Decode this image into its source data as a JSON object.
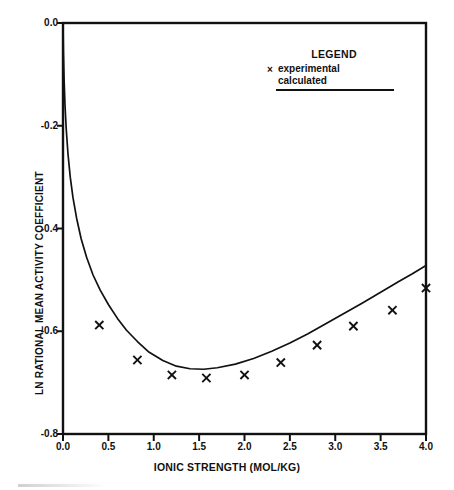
{
  "chart_data": {
    "type": "line",
    "title": "",
    "xlabel": "IONIC STRENGTH (MOL/KG)",
    "ylabel": "LN RATIONAL MEAN ACTIVITY COEFFICIENT",
    "xlim": [
      0.0,
      4.0
    ],
    "ylim": [
      -0.8,
      0.0
    ],
    "xticks": [
      "0.0",
      "0.5",
      "1.0",
      "1.5",
      "2.0",
      "2.5",
      "3.0",
      "3.5",
      "4.0"
    ],
    "xtick_values": [
      0.0,
      0.5,
      1.0,
      1.5,
      2.0,
      2.5,
      3.0,
      3.5,
      4.0
    ],
    "yticks": [
      "0.0",
      "-0.2",
      "-0.4",
      "-0.6",
      "-0.8"
    ],
    "ytick_values": [
      0.0,
      -0.2,
      -0.4,
      -0.6,
      -0.8
    ],
    "grid": false,
    "legend_position": "top-right",
    "series": [
      {
        "name": "experimental",
        "style": "scatter",
        "marker": "x",
        "color": "#111111",
        "points": [
          {
            "x": 0.4,
            "y": -0.588
          },
          {
            "x": 0.82,
            "y": -0.656
          },
          {
            "x": 1.2,
            "y": -0.685
          },
          {
            "x": 1.58,
            "y": -0.691
          },
          {
            "x": 2.0,
            "y": -0.685
          },
          {
            "x": 2.4,
            "y": -0.661
          },
          {
            "x": 2.8,
            "y": -0.627
          },
          {
            "x": 3.2,
            "y": -0.59
          },
          {
            "x": 3.63,
            "y": -0.559
          },
          {
            "x": 4.0,
            "y": -0.516
          }
        ]
      },
      {
        "name": "calculated",
        "style": "line",
        "color": "#111111",
        "points": [
          {
            "x": 0.0,
            "y": 0.0
          },
          {
            "x": 0.005,
            "y": -0.06
          },
          {
            "x": 0.012,
            "y": -0.11
          },
          {
            "x": 0.022,
            "y": -0.16
          },
          {
            "x": 0.035,
            "y": -0.205
          },
          {
            "x": 0.055,
            "y": -0.255
          },
          {
            "x": 0.08,
            "y": -0.3
          },
          {
            "x": 0.11,
            "y": -0.34
          },
          {
            "x": 0.15,
            "y": -0.38
          },
          {
            "x": 0.2,
            "y": -0.42
          },
          {
            "x": 0.26,
            "y": -0.456
          },
          {
            "x": 0.33,
            "y": -0.49
          },
          {
            "x": 0.41,
            "y": -0.52
          },
          {
            "x": 0.5,
            "y": -0.548
          },
          {
            "x": 0.6,
            "y": -0.575
          },
          {
            "x": 0.7,
            "y": -0.598
          },
          {
            "x": 0.82,
            "y": -0.62
          },
          {
            "x": 0.95,
            "y": -0.641
          },
          {
            "x": 1.1,
            "y": -0.657
          },
          {
            "x": 1.25,
            "y": -0.668
          },
          {
            "x": 1.4,
            "y": -0.673
          },
          {
            "x": 1.55,
            "y": -0.674
          },
          {
            "x": 1.7,
            "y": -0.671
          },
          {
            "x": 1.9,
            "y": -0.664
          },
          {
            "x": 2.1,
            "y": -0.653
          },
          {
            "x": 2.3,
            "y": -0.639
          },
          {
            "x": 2.5,
            "y": -0.623
          },
          {
            "x": 2.7,
            "y": -0.605
          },
          {
            "x": 2.9,
            "y": -0.585
          },
          {
            "x": 3.1,
            "y": -0.565
          },
          {
            "x": 3.3,
            "y": -0.545
          },
          {
            "x": 3.5,
            "y": -0.524
          },
          {
            "x": 3.7,
            "y": -0.503
          },
          {
            "x": 3.85,
            "y": -0.488
          },
          {
            "x": 4.0,
            "y": -0.472
          }
        ]
      }
    ],
    "legend": {
      "title": "LEGEND",
      "entries": [
        {
          "label": "experimental",
          "marker": "x"
        },
        {
          "label": "calculated",
          "marker": "line"
        }
      ]
    }
  },
  "axes": {
    "x_title": "IONIC STRENGTH (MOL/KG)",
    "y_title": "LN RATIONAL MEAN ACTIVITY COEFFICIENT"
  }
}
